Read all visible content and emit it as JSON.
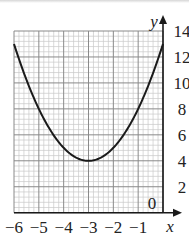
{
  "chart_data": {
    "type": "line",
    "title": "",
    "xlabel": "x",
    "ylabel": "y",
    "xlim": [
      -6,
      0
    ],
    "ylim": [
      0,
      14
    ],
    "grid": true,
    "grid_minor": true,
    "legend": null,
    "x_ticks": [
      -6,
      -5,
      -4,
      -3,
      -2,
      -1
    ],
    "x_tick_labels": [
      "−6",
      "−5",
      "−4",
      "−3",
      "−2",
      "−1"
    ],
    "y_ticks": [
      2,
      4,
      6,
      8,
      10,
      12,
      14
    ],
    "y_tick_labels": [
      "2",
      "4",
      "6",
      "8",
      "10",
      "12",
      "14"
    ],
    "origin_label": "0",
    "series": [
      {
        "name": "curve",
        "equation": "y = (x + 3)^2 + 4",
        "x": [
          -6,
          -5.5,
          -5,
          -4.5,
          -4,
          -3.5,
          -3,
          -2.5,
          -2,
          -1.5,
          -1,
          -0.5,
          0
        ],
        "y": [
          13,
          10.25,
          8,
          6.25,
          5,
          4.25,
          4,
          4.25,
          5,
          6.25,
          8,
          10.25,
          13
        ]
      }
    ],
    "annotations": [
      "minimum at (-3, 4)"
    ]
  },
  "colors": {
    "curve": "#1a1a1a",
    "axis": "#1a1a1a",
    "grid_major": "#8a8a8a",
    "grid_minor": "#c8c8c8"
  }
}
